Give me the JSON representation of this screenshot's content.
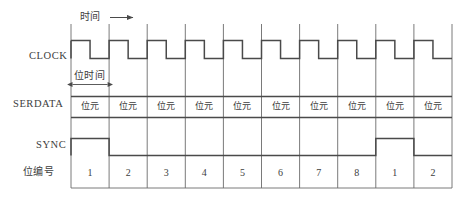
{
  "diagram": {
    "title_axis": "时间",
    "axis_arrow": "arrow-right",
    "bit_time_label": "位时间",
    "signals": [
      {
        "name": "clock",
        "label": "CLOCK"
      },
      {
        "name": "serdata",
        "label": "SERDATA"
      },
      {
        "name": "sync",
        "label": "SYNC"
      },
      {
        "name": "bitnumber",
        "label": "位编号"
      }
    ],
    "cell_count": 10,
    "serdata_cells": [
      "位元",
      "位元",
      "位元",
      "位元",
      "位元",
      "位元",
      "位元",
      "位元",
      "位元",
      "位元"
    ],
    "bit_numbers": [
      "1",
      "2",
      "3",
      "4",
      "5",
      "6",
      "7",
      "8",
      "1",
      "2"
    ],
    "clock": {
      "description": "square wave, one cycle per bit cell, high in first half",
      "levels": [
        "high",
        "low",
        "high",
        "low",
        "high",
        "low",
        "high",
        "low",
        "high",
        "low",
        "high",
        "low",
        "high",
        "low",
        "high",
        "low",
        "high",
        "low",
        "high",
        "low"
      ]
    },
    "sync": {
      "description": "pulse high during bit 1 of each 8-bit frame",
      "high_cells": [
        0,
        8
      ]
    },
    "colors": {
      "line": "#4a4a4a",
      "grid": "#6b6b6b",
      "text": "#3d3d3d",
      "background": "#ffffff"
    }
  }
}
